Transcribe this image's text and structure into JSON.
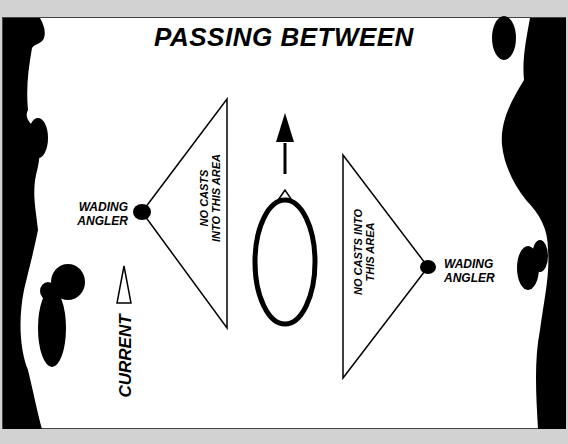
{
  "diagram": {
    "title": "PASSING BETWEEN",
    "left_angler": {
      "label_line1": "WADING",
      "label_line2": "ANGLER"
    },
    "right_angler": {
      "label_line1": "WADING",
      "label_line2": "ANGLER"
    },
    "left_zone": {
      "line1": "NO CASTS",
      "line2": "INTO THIS AREA"
    },
    "right_zone": {
      "line1": "NO CASTS INTO",
      "line2": "THIS AREA"
    },
    "current_label": "CURRENT",
    "icons": {
      "boat": "canoe-outline-icon",
      "direction": "up-arrow-icon",
      "current": "current-wedge-icon",
      "angler": "filled-circle-icon"
    },
    "colors": {
      "background": "#ffffff",
      "bank": "#000000",
      "border": "#d2d2d2"
    }
  }
}
